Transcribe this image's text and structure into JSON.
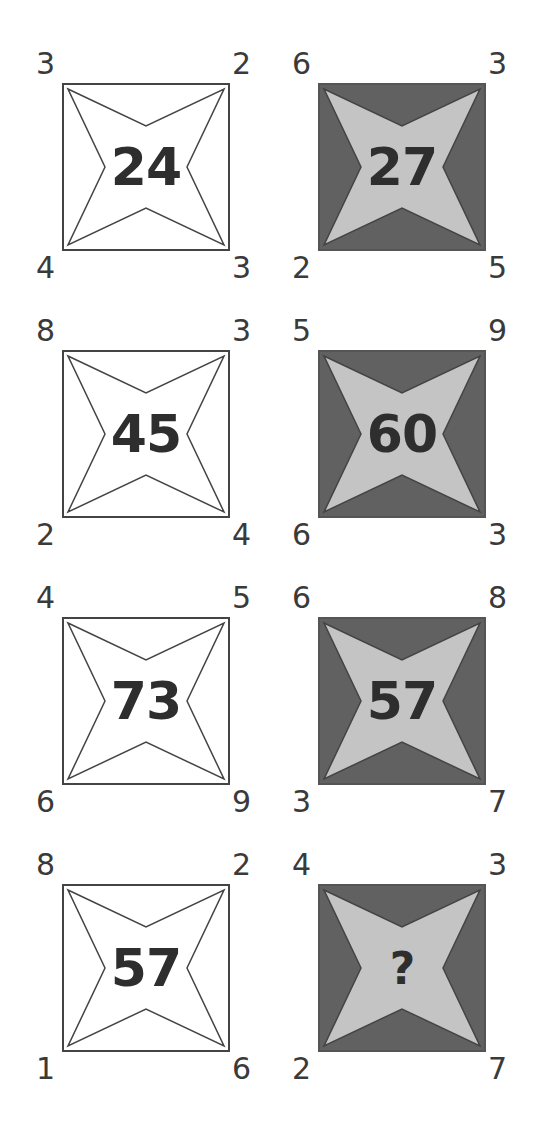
{
  "puzzle": {
    "colors": {
      "white_box_fill": "#ffffff",
      "white_star_fill": "#ffffff",
      "dark_box_fill": "#616161",
      "dark_star_fill": "#c4c4c4",
      "outline": "#444444",
      "text": "#333333"
    },
    "boxes": [
      {
        "style": "white",
        "tl": "3",
        "tr": "2",
        "bl": "4",
        "br": "3",
        "center": "24"
      },
      {
        "style": "dark",
        "tl": "6",
        "tr": "3",
        "bl": "2",
        "br": "5",
        "center": "27"
      },
      {
        "style": "white",
        "tl": "8",
        "tr": "3",
        "bl": "2",
        "br": "4",
        "center": "45"
      },
      {
        "style": "dark",
        "tl": "5",
        "tr": "9",
        "bl": "6",
        "br": "3",
        "center": "60"
      },
      {
        "style": "white",
        "tl": "4",
        "tr": "5",
        "bl": "6",
        "br": "9",
        "center": "73"
      },
      {
        "style": "dark",
        "tl": "6",
        "tr": "8",
        "bl": "3",
        "br": "7",
        "center": "57"
      },
      {
        "style": "white",
        "tl": "8",
        "tr": "2",
        "bl": "1",
        "br": "6",
        "center": "57"
      },
      {
        "style": "dark",
        "tl": "4",
        "tr": "3",
        "bl": "2",
        "br": "7",
        "center": "?"
      }
    ]
  }
}
